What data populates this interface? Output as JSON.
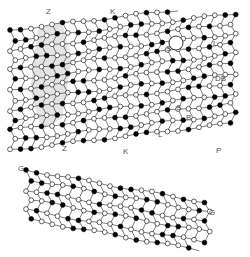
{
  "figure": {
    "colors": {
      "edge": "#444444",
      "filled_node": "#000000",
      "open_node": "#ffffff",
      "shade": "#d9d9d9",
      "label": "#555555"
    }
  },
  "labels": [
    {
      "id": "Z1",
      "text": "Z",
      "x": 46,
      "y": 8
    },
    {
      "id": "K1",
      "text": "K",
      "x": 110,
      "y": 8
    },
    {
      "id": "S1",
      "text": "S",
      "x": 166,
      "y": 45
    },
    {
      "id": "L1",
      "text": "L",
      "x": 213,
      "y": 40
    },
    {
      "id": "DB",
      "text": "DB",
      "x": 215,
      "y": 75
    },
    {
      "id": "S2",
      "text": "S",
      "x": 176,
      "y": 104
    },
    {
      "id": "B1",
      "text": "B",
      "x": 186,
      "y": 114
    },
    {
      "id": "L2",
      "text": "L",
      "x": 158,
      "y": 131
    },
    {
      "id": "K2",
      "text": "K",
      "x": 123,
      "y": 148
    },
    {
      "id": "Z2",
      "text": "Z",
      "x": 62,
      "y": 145
    },
    {
      "id": "P1",
      "text": "P",
      "x": 216,
      "y": 147
    },
    {
      "id": "G1",
      "text": "G",
      "x": 18,
      "y": 165
    },
    {
      "id": "G2",
      "text": "G",
      "x": 209,
      "y": 209
    }
  ],
  "lattice": {
    "upper": {
      "x0": 10,
      "y0": 30,
      "cols": 22,
      "rows": 13,
      "dx": 10.5,
      "dy": 10,
      "skew": -0.12
    },
    "lower": {
      "x0": 26,
      "y0": 170,
      "cols": 18,
      "rows": 6,
      "dx": 10.5,
      "dy": 10,
      "skew": 0.18
    },
    "open_circle": {
      "x": 176,
      "y": 43,
      "r": 7
    }
  }
}
